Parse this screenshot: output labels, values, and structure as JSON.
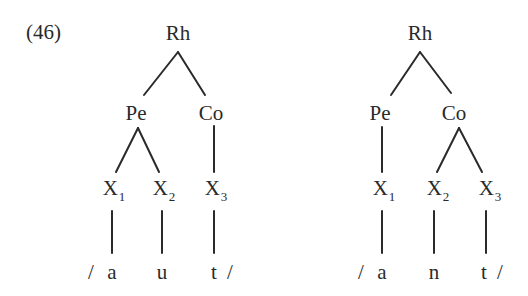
{
  "example_number": "(46)",
  "trees": [
    {
      "id": "left",
      "root": {
        "label": "Rh",
        "x": 178,
        "y": 33
      },
      "nodes": [
        {
          "label": "Pe",
          "x": 136,
          "y": 113
        },
        {
          "label": "Co",
          "x": 211,
          "y": 113
        }
      ],
      "skeleton": [
        {
          "label": "X",
          "sub": "1",
          "x": 114,
          "y": 188
        },
        {
          "label": "X",
          "sub": "2",
          "x": 164,
          "y": 188
        },
        {
          "label": "X",
          "sub": "3",
          "x": 216,
          "y": 188
        }
      ],
      "segments": [
        {
          "label": "/",
          "x": 91,
          "y": 272
        },
        {
          "label": "a",
          "x": 112,
          "y": 272
        },
        {
          "label": "u",
          "x": 162,
          "y": 272
        },
        {
          "label": "t",
          "x": 214,
          "y": 272
        },
        {
          "label": "/",
          "x": 230,
          "y": 272
        }
      ],
      "edges": [
        [
          178,
          52,
          144,
          95
        ],
        [
          178,
          52,
          205,
          95
        ],
        [
          138,
          128,
          116,
          172
        ],
        [
          138,
          128,
          159,
          172
        ],
        [
          214,
          126,
          214,
          172
        ],
        [
          112,
          211,
          112,
          253
        ],
        [
          162,
          211,
          162,
          253
        ],
        [
          214,
          211,
          214,
          253
        ]
      ]
    },
    {
      "id": "right",
      "root": {
        "label": "Rh",
        "x": 420,
        "y": 33
      },
      "nodes": [
        {
          "label": "Pe",
          "x": 380,
          "y": 113
        },
        {
          "label": "Co",
          "x": 454,
          "y": 113
        }
      ],
      "skeleton": [
        {
          "label": "X",
          "sub": "1",
          "x": 384,
          "y": 188
        },
        {
          "label": "X",
          "sub": "2",
          "x": 438,
          "y": 188
        },
        {
          "label": "X",
          "sub": "3",
          "x": 490,
          "y": 188
        }
      ],
      "segments": [
        {
          "label": "/",
          "x": 361,
          "y": 272
        },
        {
          "label": "a",
          "x": 382,
          "y": 272
        },
        {
          "label": "n",
          "x": 434,
          "y": 272
        },
        {
          "label": "t",
          "x": 484,
          "y": 272
        },
        {
          "label": "/",
          "x": 500,
          "y": 272
        }
      ],
      "edges": [
        [
          420,
          52,
          391,
          95
        ],
        [
          420,
          52,
          451,
          93
        ],
        [
          382,
          127,
          382,
          172
        ],
        [
          459,
          128,
          437,
          172
        ],
        [
          459,
          128,
          482,
          172
        ],
        [
          382,
          211,
          382,
          253
        ],
        [
          434,
          211,
          434,
          253
        ],
        [
          486,
          211,
          486,
          253
        ]
      ]
    }
  ]
}
